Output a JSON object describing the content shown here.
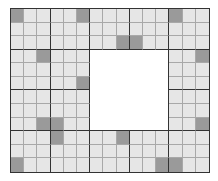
{
  "board": {
    "cols": 15,
    "rows": 12,
    "block_cols": 3,
    "block_rows": 3,
    "colors": {
      "cell": "#e6e6e6",
      "shaded": "#9a9a9a",
      "empty": "#ffffff",
      "thin_line": "#a8a8a8",
      "thick_line": "#333333"
    },
    "hollow": {
      "col_start": 6,
      "col_end": 11,
      "row_start": 3,
      "row_end": 8
    },
    "shaded_cells": [
      [
        0,
        0
      ],
      [
        0,
        5
      ],
      [
        0,
        12
      ],
      [
        2,
        8
      ],
      [
        2,
        9
      ],
      [
        3,
        2
      ],
      [
        3,
        14
      ],
      [
        5,
        5
      ],
      [
        8,
        2
      ],
      [
        8,
        3
      ],
      [
        8,
        14
      ],
      [
        9,
        3
      ],
      [
        9,
        8
      ],
      [
        11,
        0
      ],
      [
        11,
        11
      ],
      [
        11,
        12
      ]
    ]
  }
}
